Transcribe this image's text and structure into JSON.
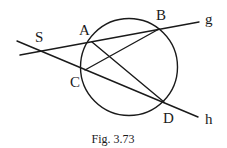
{
  "figure": {
    "caption": "Fig. 3.73",
    "stroke_color": "#1a1a1a",
    "background": "#ffffff"
  },
  "circle": {
    "cx": 129,
    "cy": 67,
    "r": 48.5
  },
  "points": {
    "S": {
      "label": "S",
      "x": 43,
      "y": 52,
      "lx": 35,
      "ly": 42
    },
    "A": {
      "label": "A",
      "x": 92,
      "y": 42,
      "lx": 79,
      "ly": 35
    },
    "B": {
      "label": "B",
      "x": 159,
      "y": 29,
      "lx": 156,
      "ly": 20
    },
    "C": {
      "label": "C",
      "x": 85,
      "y": 70,
      "lx": 70,
      "ly": 87
    },
    "D": {
      "label": "D",
      "x": 164,
      "y": 102,
      "lx": 163,
      "ly": 123
    }
  },
  "lines": {
    "g": {
      "label": "g",
      "x1": 20,
      "y1": 55,
      "x2": 199,
      "y2": 22,
      "lx": 205,
      "ly": 24
    },
    "h": {
      "label": "h",
      "x1": 17,
      "y1": 41,
      "x2": 198,
      "y2": 117,
      "lx": 205,
      "ly": 124
    }
  },
  "segments": [
    {
      "name": "segment-AD",
      "from": "A",
      "to": "D"
    },
    {
      "name": "segment-CB",
      "from": "C",
      "to": "B"
    }
  ]
}
